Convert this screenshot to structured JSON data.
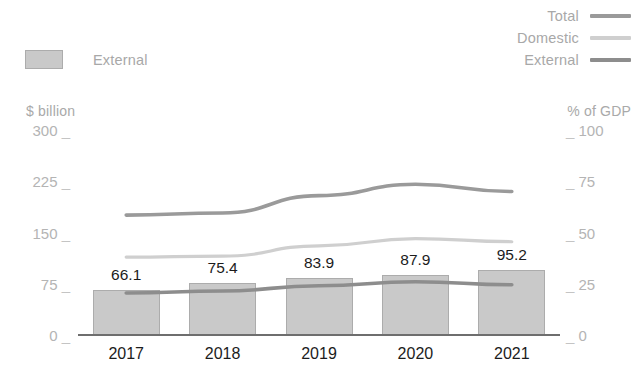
{
  "legend": {
    "bar": {
      "label": "External",
      "color": "#c9c9c9",
      "border": "#acacac"
    },
    "lines": [
      {
        "label": "Total",
        "color": "#9a9a9a"
      },
      {
        "label": "Domestic",
        "color": "#cfcfcf"
      },
      {
        "label": "External",
        "color": "#8d8d8d"
      }
    ]
  },
  "axes": {
    "left_title": "$ billion",
    "right_title": "% of GDP",
    "left_ticks": [
      "300",
      "225",
      "150",
      "75",
      "0"
    ],
    "right_ticks": [
      "100",
      "75",
      "50",
      "25",
      "0"
    ],
    "tick_dash": "_"
  },
  "chart_data": {
    "type": "bar",
    "title": "",
    "xlabel": "",
    "ylabel": "$ billion",
    "y2label": "% of GDP",
    "categories": [
      "2017",
      "2018",
      "2019",
      "2020",
      "2021"
    ],
    "ylim": [
      0,
      300
    ],
    "y2lim": [
      0,
      100
    ],
    "yticks": [
      0,
      75,
      150,
      225,
      300
    ],
    "y2ticks": [
      0,
      25,
      50,
      75,
      100
    ],
    "grid": false,
    "legend_position": "top-right",
    "bars": {
      "name": "External",
      "unit": "$ billion",
      "values": [
        66.1,
        75.4,
        83.9,
        87.9,
        95.2
      ],
      "labels": [
        "66.1",
        "75.4",
        "83.9",
        "87.9",
        "95.2"
      ]
    },
    "series": [
      {
        "name": "Total",
        "axis": "right",
        "unit": "% of GDP",
        "values": [
          58.5,
          59.5,
          68.0,
          73.5,
          70.0
        ]
      },
      {
        "name": "Domestic",
        "axis": "right",
        "unit": "% of GDP",
        "values": [
          38.0,
          38.5,
          43.5,
          47.0,
          45.5
        ]
      },
      {
        "name": "External",
        "axis": "right",
        "unit": "% of GDP",
        "values": [
          20.5,
          21.5,
          24.0,
          26.0,
          24.5
        ]
      }
    ]
  }
}
